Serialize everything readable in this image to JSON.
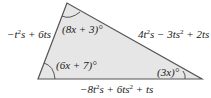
{
  "figure": {
    "type": "triangle",
    "fill": "#e6e6e6",
    "stroke": "#555555",
    "vertices": {
      "top": [
        67,
        3
      ],
      "bottom_left": [
        38,
        79
      ],
      "bottom_right": [
        202,
        79
      ]
    },
    "angles": {
      "top": "(8x + 3)°",
      "bottom_left": "(6x + 7)°",
      "bottom_right": "(3x)°"
    },
    "sides": {
      "left": {
        "pre": "−t",
        "sup": "2",
        "post": "s + 6ts"
      },
      "right": {
        "pre": "4t",
        "sup1": "2",
        "mid": "s − 3ts",
        "sup2": "2",
        "post": " + 2ts"
      },
      "bottom": {
        "pre": "−8t",
        "sup1": "2",
        "mid": "s + 6ts",
        "sup2": "2",
        "post": " + ts"
      }
    }
  }
}
